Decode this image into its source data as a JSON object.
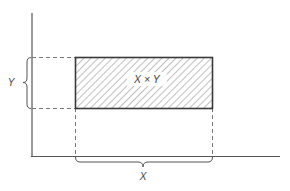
{
  "diagram": {
    "area_label": "X × Y",
    "x_label": "X",
    "y_label": "Y",
    "colors": {
      "axis": "#555555",
      "rect_border": "#3a3a3a",
      "hatch": "#8a8a8a",
      "dashed": "#777777",
      "brace": "#555555",
      "text": "#444444"
    }
  }
}
